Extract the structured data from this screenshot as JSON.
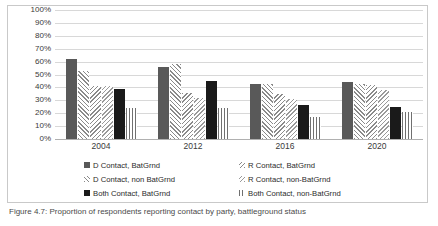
{
  "chart_data": {
    "type": "bar",
    "title": "",
    "xlabel": "",
    "ylabel": "",
    "ylim": [
      0,
      100
    ],
    "grid": true,
    "legend_position": "bottom",
    "categories": [
      "2004",
      "2012",
      "2016",
      "2020"
    ],
    "ytick_labels": [
      "100%",
      "90%",
      "80%",
      "70%",
      "60%",
      "50%",
      "40%",
      "30%",
      "20%",
      "10%",
      "0%"
    ],
    "series": [
      {
        "name": "D Contact, BatGrnd",
        "pattern": "solid-dark-gray",
        "values": [
          62,
          56,
          43,
          44
        ]
      },
      {
        "name": "D Contact, non BatGrnd",
        "pattern": "diagonal-hatch-up",
        "values": [
          53,
          58,
          43,
          43
        ]
      },
      {
        "name": "Both Contact, BatGrnd",
        "pattern": "solid-black",
        "values": [
          39,
          45,
          26,
          25
        ]
      },
      {
        "name": "R Contact, BatGrnd",
        "pattern": "diagonal-hatch-dn",
        "values": [
          41,
          36,
          35,
          42
        ]
      },
      {
        "name": "R Contact, non-BatGrnd",
        "pattern": "diagonal-hatch-lt",
        "values": [
          41,
          32,
          31,
          38
        ]
      },
      {
        "name": "Both Contact, non-BatGrnd",
        "pattern": "vertical-hatch",
        "values": [
          24,
          24,
          17,
          21
        ]
      }
    ],
    "plot_order": [
      "D Contact, BatGrnd",
      "D Contact, non BatGrnd",
      "R Contact, BatGrnd",
      "R Contact, non-BatGrnd",
      "Both Contact, BatGrnd",
      "Both Contact, non-BatGrnd"
    ]
  },
  "legend": {
    "rows": [
      {
        "left": "D Contact, BatGrnd",
        "right": "R Contact, BatGrnd"
      },
      {
        "left": "D Contact, non BatGrnd",
        "right": "R Contact, non-BatGrnd"
      },
      {
        "left": "Both Contact, BatGrnd",
        "right": "Both Contact, non-BatGrnd"
      }
    ]
  },
  "caption": {
    "text": "Figure 4.7: Proportion of respondents reporting contact by party, battleground status"
  }
}
